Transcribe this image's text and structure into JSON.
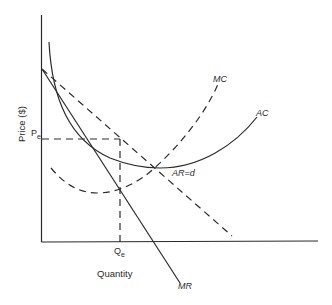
{
  "diagram": {
    "axes": {
      "x_label": "Quantity",
      "y_label": "Price ($)"
    },
    "markers": {
      "price": "Pe",
      "price_main": "P",
      "price_sub": "e",
      "quantity_main": "Q",
      "quantity_sub": "e"
    },
    "curves": {
      "mc": "MC",
      "ac": "AC",
      "ar": "AR=d",
      "mr": "MR"
    },
    "colors": {
      "line": "#2a2a2a",
      "background": "#ffffff"
    }
  }
}
